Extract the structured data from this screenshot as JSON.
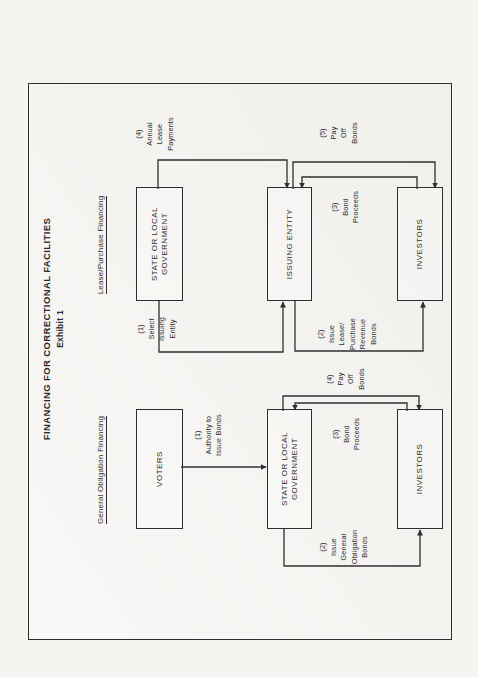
{
  "document": {
    "main_title": "FINANCING FOR CORRECTIONAL FACILITIES",
    "exhibit_label": "Exhibit 1"
  },
  "general_obligation": {
    "heading": "General Obligation Financing",
    "boxes": {
      "voters": "VOTERS",
      "government": "STATE OR LOCAL\nGOVERNMENT",
      "investors": "INVESTORS"
    },
    "flows": {
      "authority": "(1)\nAuthority to\nIssue Bonds",
      "issue_bonds": "(2)\nIssue\nGeneral\nObligation\nBonds",
      "bond_proceeds": "(3)\nBond\nProceeds",
      "pay_off": "(4)\nPay\nOff\nBonds"
    }
  },
  "lease_purchase": {
    "heading": "Lease/Purchase Financing",
    "boxes": {
      "government": "STATE OR LOCAL\nGOVERNMENT",
      "issuing_entity": "ISSUING ENTITY",
      "investors": "INVESTORS"
    },
    "flows": {
      "select": "(1)\nSelect\nIssuing\nEntity",
      "issue_bonds": "(2)\nIssue\nLease/\nPurchase\nRevenue\nBonds",
      "bond_proceeds": "(3)\nBond\nProceeds",
      "annual_lease": "(4)\nAnnual\nLease\nPayments",
      "pay_off": "(5)\nPay\nOff\nBonds"
    }
  },
  "colors": {
    "ink": "#2c2c2c",
    "line": "#303030",
    "paper": "#f5f4f1"
  }
}
